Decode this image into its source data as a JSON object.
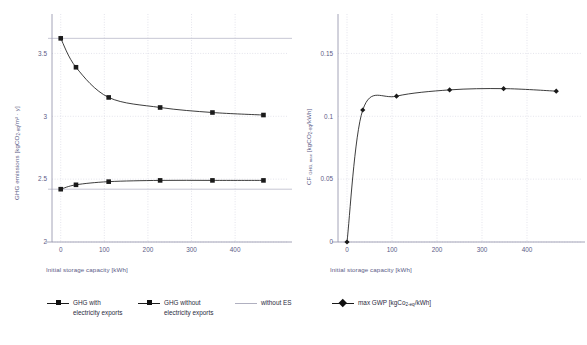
{
  "figure": {
    "background_color": "#ffffff",
    "axis_text_color": "#5b5b86",
    "series_color": "#1a1a1a",
    "reference_line_color": "#b8b8c8",
    "grid_color": "#d9d9e4"
  },
  "panels": [
    {
      "id": "left",
      "xlabel": "Initial storage capacity [kWh]",
      "ylabel_parts": {
        "pre": "GHG emissions [kgCO",
        "sub": "2-eq",
        "post": "/m² · y]"
      },
      "xticks": [
        "0",
        "100",
        "200",
        "300",
        "400"
      ],
      "yticks": [
        "2",
        "2.5",
        "3",
        "3.5"
      ]
    },
    {
      "id": "right",
      "xlabel": "Initial storage capacity [kWh]",
      "ylabel_parts": {
        "pre": "CF ",
        "sub_small": "GHG, max",
        "mid": " [kgCO",
        "sub": "2-eq",
        "post": "/kWh]"
      },
      "xticks": [
        "0",
        "100",
        "200",
        "300",
        "400"
      ],
      "yticks": [
        "0",
        "0.05",
        "0.1",
        "0.15"
      ]
    }
  ],
  "legend": {
    "items": [
      {
        "name": "ghg-with-exports",
        "key": "line-marker-square",
        "label": "GHG with electricity exports"
      },
      {
        "name": "ghg-without-exports",
        "key": "line-marker-square",
        "label": "GHG without electricity exports"
      },
      {
        "name": "without-es",
        "key": "line-plain",
        "label": "without ES"
      },
      {
        "name": "max-gwp",
        "key": "line-marker-diamond",
        "label_pre": "max GWP [kgCo",
        "label_sub": "2-eq",
        "label_post": "/kWh]"
      }
    ]
  },
  "chart_data": [
    {
      "type": "line",
      "panel": "left",
      "title": "",
      "xlabel": "Initial storage capacity [kWh]",
      "ylabel": "GHG emissions [kgCO2-eq/m² · y]",
      "xlim": [
        -20,
        480
      ],
      "ylim": [
        2,
        3.75
      ],
      "xticks": [
        0,
        100,
        200,
        300,
        400
      ],
      "yticks": [
        2,
        2.5,
        3,
        3.5
      ],
      "grid": true,
      "legend_position": "below-figure",
      "x": [
        0,
        35,
        110,
        228,
        348,
        465
      ],
      "series": [
        {
          "name": "GHG with electricity exports",
          "marker": "square",
          "values": [
            3.62,
            3.39,
            3.15,
            3.07,
            3.03,
            3.01
          ]
        },
        {
          "name": "GHG without electricity exports",
          "marker": "square",
          "values": [
            2.42,
            2.455,
            2.48,
            2.49,
            2.49,
            2.49
          ]
        }
      ],
      "reference_lines": [
        {
          "name": "without ES",
          "orientation": "horizontal",
          "value": 3.62
        },
        {
          "name": "without ES",
          "orientation": "horizontal",
          "value": 2.42
        }
      ]
    },
    {
      "type": "line",
      "panel": "right",
      "title": "",
      "xlabel": "Initial storage capacity [kWh]",
      "ylabel": "CF GHG, max [kgCO2-eq/kWh]",
      "xlim": [
        -20,
        480
      ],
      "ylim": [
        0,
        0.175
      ],
      "xticks": [
        0,
        100,
        200,
        300,
        400
      ],
      "yticks": [
        0,
        0.05,
        0.1,
        0.15
      ],
      "grid": true,
      "legend_position": "below-figure",
      "x": [
        0,
        35,
        110,
        228,
        348,
        465
      ],
      "series": [
        {
          "name": "max GWP [kgCo2-eq/kWh]",
          "marker": "diamond",
          "values": [
            0.0,
            0.105,
            0.116,
            0.121,
            0.122,
            0.12
          ]
        }
      ]
    }
  ]
}
